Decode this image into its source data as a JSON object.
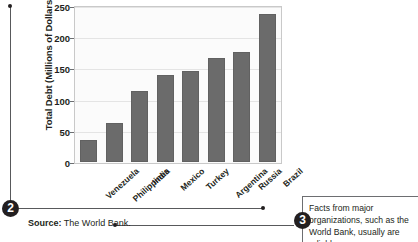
{
  "chart_data": {
    "type": "bar",
    "title": "",
    "xlabel": "",
    "ylabel": "Total Debt (Millions of Dollars)",
    "ylim": [
      0,
      250
    ],
    "yticks": [
      0,
      50,
      100,
      150,
      200,
      250
    ],
    "grid": true,
    "legend": "none",
    "bar_color": "#6b6b6b",
    "plot_background": "#fbfbfb",
    "categories": [
      "Venezuela",
      "Philippines",
      "India",
      "Mexico",
      "Turkey",
      "Argentina",
      "Russia",
      "Brazil"
    ],
    "values": [
      35,
      62,
      114,
      140,
      146,
      166,
      176,
      237
    ]
  },
  "source": {
    "label": "Source:",
    "value": "The World Bank."
  },
  "callouts": [
    {
      "number": "2"
    },
    {
      "number": "3"
    }
  ],
  "annotation": {
    "text": "Facts from major organizations, such as the World Bank, usually are reliable."
  }
}
